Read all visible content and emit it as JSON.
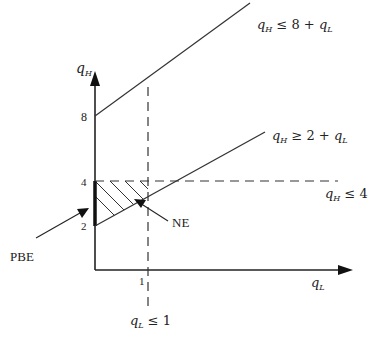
{
  "diagram": {
    "type": "economics-constraint-diagram",
    "axes": {
      "y_label": {
        "var": "q",
        "sub": "H"
      },
      "x_label": {
        "var": "q",
        "sub": "L"
      },
      "y_ticks": [
        "8",
        "4",
        "2"
      ],
      "x_ticks": [
        "1"
      ]
    },
    "constraints": {
      "upper": {
        "var": "q",
        "sub": "H",
        "rel": " ≤ 8 + ",
        "var2": "q",
        "sub2": "L"
      },
      "lower": {
        "var": "q",
        "sub": "H",
        "rel": " ≥ 2 + ",
        "var2": "q",
        "sub2": "L"
      },
      "horizontal": {
        "var": "q",
        "sub": "H",
        "rel": " ≤ 4"
      },
      "vertical": {
        "var": "q",
        "sub": "L",
        "rel": " ≤ 1"
      }
    },
    "annotations": {
      "ne": "NE",
      "pbe": "PBE"
    },
    "colors": {
      "line": "#222222",
      "background": "#ffffff"
    }
  }
}
